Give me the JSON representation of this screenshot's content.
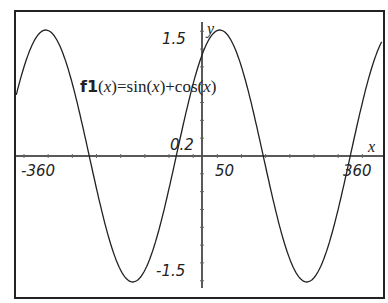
{
  "chart_data": {
    "type": "line",
    "title": "",
    "function_label": {
      "name": "f1",
      "arg": "x",
      "expr": "=sin(x)+cos(x)"
    },
    "xlabel": "x",
    "ylabel": "y",
    "xlim": [
      -360,
      360
    ],
    "ylim": [
      -1.5,
      1.5
    ],
    "x_tick_labels": [
      "-360",
      "50",
      "360"
    ],
    "y_tick_labels": [
      "1.5",
      "0.2",
      "-1.5"
    ],
    "grid": false,
    "series": [
      {
        "name": "f1(x)=sin(x)+cos(x)",
        "x": [
          -360,
          -315,
          -270,
          -225,
          -180,
          -135,
          -90,
          -45,
          0,
          45,
          90,
          135,
          180,
          225,
          270,
          315,
          360
        ],
        "values": [
          1,
          1.414,
          1,
          0,
          -1,
          -1.414,
          -1,
          0,
          1,
          1.414,
          1,
          0,
          -1,
          -1.414,
          -1,
          0,
          1
        ]
      }
    ]
  },
  "labels": {
    "fn_name": "f1",
    "fn_open": "(",
    "fn_var": "x",
    "fn_close": ")",
    "fn_expr_1": "=sin(",
    "fn_expr_var1": "x",
    "fn_expr_2": ")+cos(",
    "fn_expr_var2": "x",
    "fn_expr_3": ")",
    "x_axis_var": "x",
    "y_axis_var": "y",
    "x_min_label": "-360",
    "x_tick_label": "50",
    "x_max_label": "360",
    "y_max_label": "1.5",
    "y_tick_label": "0.2",
    "y_min_label": "-1.5"
  }
}
